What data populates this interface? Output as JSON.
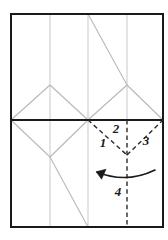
{
  "figure": {
    "type": "crease-pattern",
    "canvas": {
      "width": 168,
      "height": 240
    },
    "colors": {
      "sheet_border": "#1a1a1a",
      "mountain_crease": "#b8b8b8",
      "grid_line": "#c9c9c9",
      "fold_dashed": "#2b2b2b",
      "arrow": "#1a1a1a",
      "label": "#1a1a1a",
      "background": "#ffffff"
    },
    "sheet": {
      "left": 11,
      "top": 14,
      "right": 163,
      "bottom": 227,
      "border_width": 2
    },
    "horizontal_midline": {
      "y": 120,
      "from_x": 11,
      "to_x": 163,
      "width": 2
    },
    "vertical_grid_x": [
      50,
      88,
      127
    ],
    "labels": [
      {
        "id": "label-1",
        "text": "1",
        "x": 103,
        "y": 147
      },
      {
        "id": "label-2",
        "text": "2",
        "x": 116,
        "y": 133
      },
      {
        "id": "label-3",
        "text": "3",
        "x": 146,
        "y": 145
      },
      {
        "id": "label-4",
        "text": "4",
        "x": 118,
        "y": 196
      }
    ],
    "fold_arrow": {
      "name": "rotate-fold-arrow",
      "direction": "counter-clockwise-left",
      "path": "M 155 170 Q 126 184 97 172",
      "arrowhead": "M 97 172 L 105 171 M 97 172 L 100 179"
    },
    "dashed_creases": [
      {
        "id": "crease-1",
        "from": [
          88,
          120
        ],
        "to": [
          127,
          155
        ]
      },
      {
        "id": "crease-3",
        "from": [
          127,
          155
        ],
        "to": [
          163,
          120
        ]
      },
      {
        "id": "crease-2-axis",
        "from": [
          127,
          120
        ],
        "to": [
          127,
          227
        ]
      }
    ],
    "gray_creases": [
      {
        "id": "upper-left-diamond-left",
        "from": [
          11,
          120
        ],
        "to": [
          50,
          85
        ]
      },
      {
        "id": "upper-left-diamond-right",
        "from": [
          50,
          85
        ],
        "to": [
          88,
          120
        ]
      },
      {
        "id": "lower-left-diamond-left",
        "from": [
          11,
          120
        ],
        "to": [
          50,
          157
        ]
      },
      {
        "id": "lower-left-diamond-right",
        "from": [
          50,
          157
        ],
        "to": [
          88,
          120
        ]
      },
      {
        "id": "upper-right-triangle-left",
        "from": [
          88,
          120
        ],
        "to": [
          127,
          85
        ]
      },
      {
        "id": "upper-right-triangle-right",
        "from": [
          127,
          85
        ],
        "to": [
          163,
          120
        ]
      },
      {
        "id": "top-long-diagonal",
        "from": [
          88,
          14
        ],
        "to": [
          127,
          85
        ]
      },
      {
        "id": "bottom-long-diagonal",
        "from": [
          50,
          157
        ],
        "to": [
          88,
          227
        ]
      }
    ]
  }
}
